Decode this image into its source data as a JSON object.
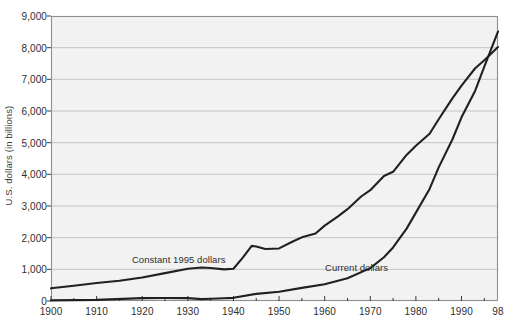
{
  "chart_data": {
    "type": "line",
    "title": "",
    "xlabel": "",
    "ylabel": "U.S. dollars (in billions)",
    "xlim": [
      1900,
      1998
    ],
    "ylim": [
      0,
      9000
    ],
    "grid": true,
    "legend_position": "inline-annotations",
    "ytick_labels": [
      "9,000",
      "8,000",
      "7,000",
      "6,000",
      "5,000",
      "4,000",
      "3,000",
      "2,000",
      "1,000",
      "0"
    ],
    "ytick_values": [
      9000,
      8000,
      7000,
      6000,
      5000,
      4000,
      3000,
      2000,
      1000,
      0
    ],
    "xtick_labels": [
      "1900",
      "1910",
      "1920",
      "1930",
      "1940",
      "1950",
      "1960",
      "1970",
      "1980",
      "1990",
      "98"
    ],
    "xtick_values": [
      1900,
      1910,
      1920,
      1930,
      1940,
      1950,
      1960,
      1970,
      1980,
      1990,
      1998
    ],
    "series": [
      {
        "name": "Constant 1995 dollars",
        "color": "#231f20",
        "annotation_x": 1928,
        "annotation_y": 1320,
        "x": [
          1900,
          1905,
          1910,
          1915,
          1920,
          1925,
          1930,
          1933,
          1935,
          1938,
          1940,
          1942,
          1944,
          1945,
          1947,
          1950,
          1953,
          1955,
          1958,
          1960,
          1963,
          1965,
          1968,
          1970,
          1973,
          1975,
          1978,
          1980,
          1983,
          1985,
          1988,
          1990,
          1993,
          1995,
          1998
        ],
        "y": [
          400,
          480,
          570,
          640,
          740,
          880,
          1020,
          1060,
          1040,
          1000,
          1020,
          1360,
          1740,
          1720,
          1640,
          1660,
          1880,
          2010,
          2130,
          2380,
          2680,
          2900,
          3300,
          3500,
          3950,
          4080,
          4620,
          4900,
          5280,
          5740,
          6400,
          6800,
          7350,
          7600,
          8020
        ]
      },
      {
        "name": "Current dollars",
        "color": "#231f20",
        "annotation_x": 1967,
        "annotation_y": 1060,
        "x": [
          1900,
          1910,
          1920,
          1925,
          1930,
          1933,
          1935,
          1938,
          1940,
          1945,
          1950,
          1955,
          1960,
          1965,
          1970,
          1973,
          1975,
          1978,
          1980,
          1983,
          1985,
          1988,
          1990,
          1993,
          1995,
          1998
        ],
        "y": [
          20,
          35,
          90,
          95,
          92,
          58,
          73,
          88,
          100,
          225,
          294,
          415,
          527,
          720,
          1039,
          1383,
          1690,
          2294,
          2790,
          3540,
          4220,
          5100,
          5800,
          6640,
          7400,
          8510
        ]
      }
    ]
  },
  "axes": {
    "plot_left_px": 51,
    "plot_right_px": 498,
    "plot_top_px": 16,
    "plot_bottom_px": 301
  },
  "colors": {
    "plot_background": "#f2f2f2",
    "plot_border": "#8f8f8f",
    "gridline": "#b9b9b9",
    "line": "#231f20",
    "text": "#2e2e2e",
    "page_background": "#ffffff"
  }
}
